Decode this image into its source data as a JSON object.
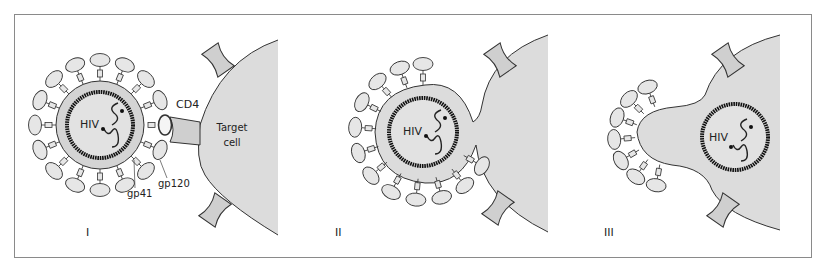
{
  "figure": {
    "colors": {
      "frame": "#8a8a8a",
      "cell_fill": "#dcdcdc",
      "virion_membrane_fill": "#d4d4d4",
      "core_fill": "#e2e2e2",
      "envelope_protein_fill": "#e6e6e6",
      "outline": "#333333",
      "capsid": "#111111"
    },
    "panels": [
      {
        "id": "I",
        "label": "I",
        "virus_label": "HIV",
        "receptor_label": "CD4",
        "cell_label_line1": "Target",
        "cell_label_line2": "cell",
        "annotations": [
          "gp41",
          "gp120"
        ]
      },
      {
        "id": "II",
        "label": "II",
        "virus_label": "HIV"
      },
      {
        "id": "III",
        "label": "III",
        "virus_label": "HIV"
      }
    ]
  }
}
